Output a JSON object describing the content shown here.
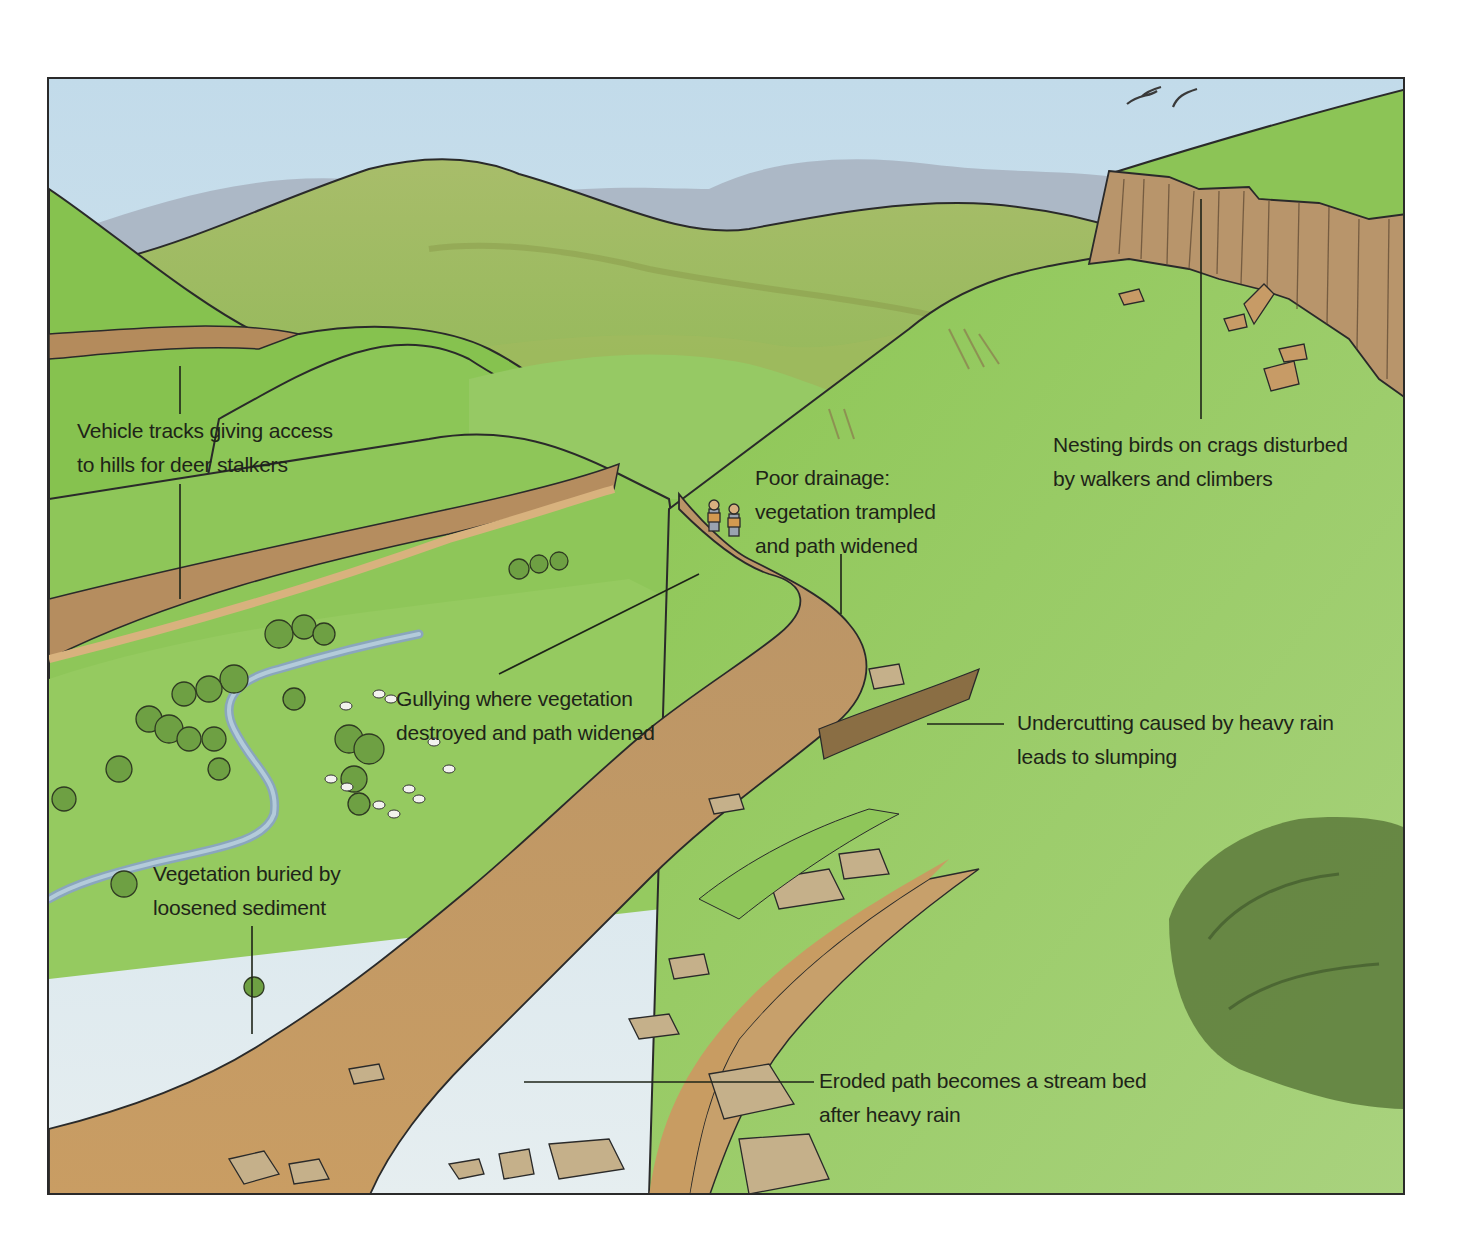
{
  "figure": {
    "colors": {
      "sky": "#cfe3ee",
      "distant_hills": "#a9b6c4",
      "far_hills": "#a8c070",
      "grass": "#86c24e",
      "grass_light": "#a6cf6e",
      "path": "#c69a62",
      "crag": "#b8956b",
      "stream": "#9cb8cc",
      "shrub": "#5e7a3c",
      "outline": "#2a2a2a",
      "text": "#1e2418"
    }
  },
  "labels": [
    {
      "id": "vehicle-tracks",
      "lines": [
        "Vehicle tracks giving access",
        "to hills for deer stalkers"
      ]
    },
    {
      "id": "nesting-birds",
      "lines": [
        "Nesting birds on crags disturbed",
        "by walkers and climbers"
      ]
    },
    {
      "id": "poor-drainage",
      "lines": [
        "Poor drainage:",
        "vegetation trampled",
        "and path widened"
      ]
    },
    {
      "id": "gullying",
      "lines": [
        "Gullying where vegetation",
        "destroyed and path widened"
      ]
    },
    {
      "id": "undercutting",
      "lines": [
        "Undercutting caused by heavy rain",
        "leads to slumping"
      ]
    },
    {
      "id": "vegetation-buried",
      "lines": [
        "Vegetation buried by",
        "loosened sediment"
      ]
    },
    {
      "id": "eroded-path",
      "lines": [
        "Eroded path becomes a stream bed",
        "after heavy rain"
      ]
    }
  ]
}
